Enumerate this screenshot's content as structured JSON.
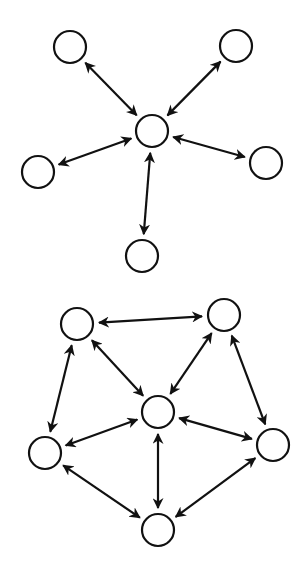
{
  "diagrams": [
    {
      "name": "star-topology",
      "node_radius": 16,
      "nodes": [
        {
          "id": "center",
          "x": 152,
          "y": 131
        },
        {
          "id": "top-left",
          "x": 70,
          "y": 47
        },
        {
          "id": "top-right",
          "x": 236,
          "y": 46
        },
        {
          "id": "left",
          "x": 38,
          "y": 172
        },
        {
          "id": "right",
          "x": 266,
          "y": 163
        },
        {
          "id": "bottom",
          "x": 142,
          "y": 256
        }
      ],
      "edges": [
        [
          "center",
          "top-left"
        ],
        [
          "center",
          "top-right"
        ],
        [
          "center",
          "left"
        ],
        [
          "center",
          "right"
        ],
        [
          "center",
          "bottom"
        ]
      ],
      "edge_style": "bidirectional-arrow"
    },
    {
      "name": "wheel-topology",
      "node_radius": 16,
      "nodes": [
        {
          "id": "center",
          "x": 158,
          "y": 412
        },
        {
          "id": "top-left",
          "x": 77,
          "y": 324
        },
        {
          "id": "top-right",
          "x": 224,
          "y": 315
        },
        {
          "id": "left",
          "x": 45,
          "y": 453
        },
        {
          "id": "right",
          "x": 273,
          "y": 445
        },
        {
          "id": "bottom",
          "x": 158,
          "y": 530
        }
      ],
      "edges": [
        [
          "center",
          "top-left"
        ],
        [
          "center",
          "top-right"
        ],
        [
          "center",
          "left"
        ],
        [
          "center",
          "right"
        ],
        [
          "center",
          "bottom"
        ],
        [
          "top-left",
          "top-right"
        ],
        [
          "top-right",
          "right"
        ],
        [
          "right",
          "bottom"
        ],
        [
          "bottom",
          "left"
        ],
        [
          "left",
          "top-left"
        ]
      ],
      "edge_style": "bidirectional-arrow"
    }
  ],
  "colors": {
    "stroke": "#111111",
    "background": "#ffffff"
  }
}
